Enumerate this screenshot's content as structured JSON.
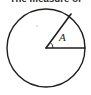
{
  "figure": {
    "header_text": "The measure of",
    "angle_label": "A",
    "ink_color": "#1f1f1f",
    "background_color": "#ffffff",
    "circle": {
      "center_x": 46,
      "center_y": 48,
      "radius": 39,
      "stroke_width": 1.4
    },
    "radii": [
      {
        "name": "horizontal-radius",
        "from_x": 46,
        "from_y": 48,
        "to_x": 85,
        "to_y": 48,
        "angle_degrees": 0
      },
      {
        "name": "slanted-radius",
        "from_x": 46,
        "from_y": 48,
        "to_x": 71,
        "to_y": 14,
        "angle_degrees": 54
      }
    ],
    "angle_arc": {
      "vertex_x": 46,
      "vertex_y": 48,
      "radius": 7,
      "start_degrees": 0,
      "end_degrees": 54
    },
    "label_position": {
      "x": 59,
      "y": 41
    },
    "speck": {
      "x": 36,
      "y": 25,
      "size": 2
    }
  }
}
